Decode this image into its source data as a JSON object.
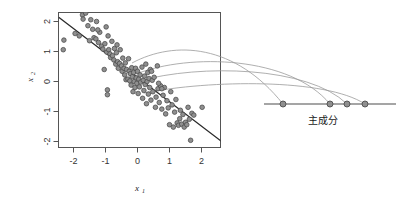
{
  "figure": {
    "name": "pca-projection-diagram",
    "background": "#ffffff",
    "point_fill": "#8f8f8f",
    "point_stroke": "#4d4d4d",
    "line_color": "#2b2b2b",
    "curve_color": "#9a9a9a"
  },
  "scatter_panel": {
    "xlabel": "x",
    "xlabel_sub": "1",
    "ylabel": "x",
    "ylabel_sub": "2",
    "x_ticks": [
      "-2",
      "-1",
      "0",
      "1",
      "2"
    ],
    "y_ticks": [
      "2",
      "1",
      "0",
      "-1",
      "-2"
    ]
  },
  "pc_axis": {
    "label": "主成分",
    "point_count": 4
  },
  "chart_data": {
    "type": "scatter",
    "title": "",
    "xlabel": "x1",
    "ylabel": "x2",
    "xlim": [
      -2.6,
      2.7
    ],
    "ylim": [
      -2.55,
      2.55
    ],
    "grid": false,
    "legend": null,
    "x_tick_values": [
      -2,
      -1,
      0,
      1,
      2
    ],
    "y_tick_values": [
      -2,
      -1,
      0,
      1,
      2
    ],
    "series": [
      {
        "name": "observations",
        "marker": "circle",
        "fill": "#8f8f8f",
        "stroke": "#4d4d4d",
        "points": [
          [
            -2.32,
            1.06
          ],
          [
            -2.3,
            1.38
          ],
          [
            -1.95,
            1.6
          ],
          [
            -1.82,
            1.52
          ],
          [
            -1.72,
            2.22
          ],
          [
            -1.7,
            2.08
          ],
          [
            -1.62,
            2.28
          ],
          [
            -1.55,
            1.86
          ],
          [
            -1.5,
            1.36
          ],
          [
            -1.46,
            2.06
          ],
          [
            -1.4,
            1.74
          ],
          [
            -1.36,
            1.46
          ],
          [
            -1.3,
            1.42
          ],
          [
            -1.28,
            2.0
          ],
          [
            -1.22,
            1.3
          ],
          [
            -1.18,
            1.64
          ],
          [
            -1.12,
            1.18
          ],
          [
            -1.08,
            1.08
          ],
          [
            -1.04,
            0.4
          ],
          [
            -1.02,
            1.26
          ],
          [
            -0.98,
            1.82
          ],
          [
            -0.96,
            0.98
          ],
          [
            -0.94,
            -0.28
          ],
          [
            -0.94,
            -0.44
          ],
          [
            -0.9,
            1.06
          ],
          [
            -0.86,
            0.92
          ],
          [
            -0.84,
            0.8
          ],
          [
            -0.8,
            1.34
          ],
          [
            -0.78,
            0.86
          ],
          [
            -0.74,
            0.72
          ],
          [
            -0.72,
            1.1
          ],
          [
            -0.68,
            0.58
          ],
          [
            -0.66,
            0.96
          ],
          [
            -0.62,
            0.66
          ],
          [
            -0.6,
            0.44
          ],
          [
            -0.56,
            0.6
          ],
          [
            -0.54,
            1.06
          ],
          [
            -0.5,
            0.52
          ],
          [
            -0.48,
            0.34
          ],
          [
            -0.46,
            0.78
          ],
          [
            -0.42,
            0.44
          ],
          [
            -0.4,
            0.22
          ],
          [
            -0.38,
            0.62
          ],
          [
            -0.36,
            0.06
          ],
          [
            -0.34,
            0.4
          ],
          [
            -0.3,
            0.08
          ],
          [
            -0.28,
            0.76
          ],
          [
            -0.26,
            0.34
          ],
          [
            -0.24,
            0.02
          ],
          [
            -0.22,
            0.26
          ],
          [
            -0.2,
            -0.12
          ],
          [
            -0.18,
            0.46
          ],
          [
            -0.16,
            0.16
          ],
          [
            -0.14,
            -0.34
          ],
          [
            -0.12,
            0.3
          ],
          [
            -0.1,
            0.0
          ],
          [
            -0.08,
            -0.2
          ],
          [
            -0.06,
            0.44
          ],
          [
            -0.04,
            0.12
          ],
          [
            -0.02,
            -0.06
          ],
          [
            0.0,
            0.34
          ],
          [
            0.02,
            -0.4
          ],
          [
            0.04,
            0.08
          ],
          [
            0.06,
            -0.18
          ],
          [
            0.08,
            0.22
          ],
          [
            0.1,
            -0.02
          ],
          [
            0.14,
            0.48
          ],
          [
            0.16,
            -0.56
          ],
          [
            0.18,
            0.04
          ],
          [
            0.2,
            -0.3
          ],
          [
            0.22,
            0.18
          ],
          [
            0.24,
            -0.1
          ],
          [
            0.26,
            0.58
          ],
          [
            0.28,
            -0.74
          ],
          [
            0.3,
            0.0
          ],
          [
            0.32,
            0.3
          ],
          [
            0.34,
            -0.42
          ],
          [
            0.36,
            0.1
          ],
          [
            0.38,
            -0.2
          ],
          [
            0.4,
            0.4
          ],
          [
            0.42,
            -0.62
          ],
          [
            0.46,
            0.04
          ],
          [
            0.48,
            -0.34
          ],
          [
            0.52,
            0.14
          ],
          [
            0.56,
            -0.86
          ],
          [
            0.58,
            -0.52
          ],
          [
            0.62,
            0.52
          ],
          [
            0.64,
            -0.24
          ],
          [
            0.68,
            -0.7
          ],
          [
            0.72,
            -0.14
          ],
          [
            0.76,
            -0.92
          ],
          [
            0.8,
            -0.46
          ],
          [
            0.84,
            -0.2
          ],
          [
            0.88,
            -1.08
          ],
          [
            0.92,
            -0.64
          ],
          [
            0.96,
            -0.88
          ],
          [
            1.0,
            -1.44
          ],
          [
            1.04,
            -0.34
          ],
          [
            1.08,
            -0.78
          ],
          [
            1.12,
            -1.52
          ],
          [
            1.16,
            -1.02
          ],
          [
            1.2,
            -0.6
          ],
          [
            1.24,
            -1.38
          ],
          [
            1.28,
            -1.46
          ],
          [
            1.34,
            -0.96
          ],
          [
            1.38,
            -1.42
          ],
          [
            1.42,
            -1.1
          ],
          [
            1.46,
            -1.52
          ],
          [
            1.5,
            -1.36
          ],
          [
            1.54,
            -1.44
          ],
          [
            1.58,
            -0.86
          ],
          [
            1.62,
            -1.26
          ],
          [
            1.66,
            -1.96
          ],
          [
            1.7,
            -1.06
          ],
          [
            1.76,
            -1.12
          ],
          [
            2.02,
            -0.86
          ],
          [
            2.38,
            -2.32
          ],
          [
            -1.24,
            1.72
          ],
          [
            -0.92,
            1.52
          ],
          [
            0.66,
            -0.06
          ],
          [
            0.76,
            -0.24
          ],
          [
            1.32,
            -1.24
          ],
          [
            0.44,
            0.34
          ],
          [
            -0.64,
            1.22
          ]
        ]
      }
    ],
    "annotations": [
      {
        "type": "line",
        "name": "principal-axis-fit",
        "from": [
          -2.42,
          2.18
        ],
        "to": [
          2.62,
          -2.28
        ],
        "color": "#2b2b2b"
      },
      {
        "type": "projection-curves",
        "name": "projection-arcs",
        "count": 4,
        "color": "#9a9a9a"
      }
    ],
    "secondary_axis": {
      "name": "principal-component-axis",
      "label": "主成分",
      "point_count": 4,
      "orientation": "horizontal"
    }
  }
}
